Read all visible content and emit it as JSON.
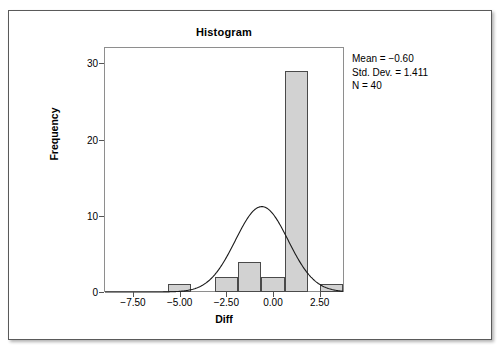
{
  "figure": {
    "title": "Histogram"
  },
  "stats": {
    "mean_line": "Mean = −0.60",
    "stddev_line": "Std. Dev. = 1.411",
    "n_line": "N = 40"
  },
  "chart_data": {
    "type": "bar",
    "title": "Histogram",
    "xlabel": "Diff",
    "ylabel": "Frequency",
    "xlim": [
      -9.0,
      3.75
    ],
    "ylim": [
      0,
      32
    ],
    "grid": false,
    "legend": null,
    "x_tick_labels": [
      "−7.50",
      "−5.00",
      "−2.50",
      "0.00",
      "2.50"
    ],
    "x_tick_values": [
      -7.5,
      -5.0,
      -2.5,
      0.0,
      2.5
    ],
    "y_tick_labels": [
      "0",
      "10",
      "20",
      "30"
    ],
    "y_tick_values": [
      0,
      10,
      20,
      30
    ],
    "bin_width": 1.25,
    "bins": [
      {
        "left": -5.625,
        "right": -4.375,
        "center": -5.0,
        "value": 1
      },
      {
        "left": -3.125,
        "right": -1.875,
        "center": -2.5,
        "value": 2
      },
      {
        "left": -1.875,
        "right": -0.625,
        "center": -1.25,
        "value": 4
      },
      {
        "left": -0.625,
        "right": 0.625,
        "center": 0.0,
        "value": 2
      },
      {
        "left": 0.625,
        "right": 1.875,
        "center": 1.25,
        "value": 29
      },
      {
        "left": 2.5,
        "right": 3.75,
        "center": 3.125,
        "value": 1
      }
    ],
    "categories": [
      "-5.00",
      "-2.50",
      "-1.25",
      "0.00",
      "1.25",
      "3.13"
    ],
    "values": [
      1,
      2,
      4,
      2,
      29,
      1
    ],
    "overlay": {
      "type": "normal_curve",
      "mean": -0.6,
      "std_dev": 1.411,
      "n": 40,
      "peak_frequency": 11.2,
      "color": "#1a1a1a"
    },
    "annotations": [
      "Mean = −0.60",
      "Std. Dev. = 1.411",
      "N = 40"
    ],
    "bar_fill_color": "#d2d2d2",
    "bar_edge_color": "#4a4a4a"
  }
}
